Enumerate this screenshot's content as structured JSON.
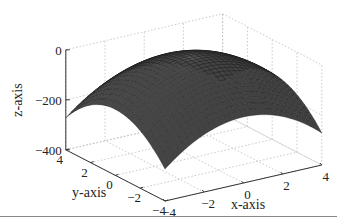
{
  "chart_data": {
    "type": "surface3d",
    "title": "",
    "function": "z = -8.5 * (x^2 + y^2)",
    "xlabel": "x-axis",
    "ylabel": "y-axis",
    "zlabel": "z-axis",
    "xlim": [
      -4,
      4
    ],
    "ylim": [
      -4,
      4
    ],
    "zlim": [
      -400,
      0
    ],
    "x_ticks": [
      -4,
      -2,
      0,
      2,
      4
    ],
    "y_ticks": [
      -4,
      -2,
      0,
      2,
      4
    ],
    "z_ticks": [
      -400,
      -200,
      0
    ],
    "x_tick_labels": [
      "−4",
      "−2",
      "0",
      "2",
      "4"
    ],
    "y_tick_labels": [
      "−4",
      "−2",
      "0",
      "2",
      "4"
    ],
    "z_tick_labels": [
      "−400",
      "−200",
      "0"
    ],
    "grid": true,
    "grid_n": 30,
    "corner_z": -272,
    "peak_z": 0,
    "colors": {
      "face_dark": "#2a2a2a",
      "face_light": "#8a8a8a",
      "edge": "#1a1a1a",
      "grid": "#bbbbbb",
      "axis": "#333333"
    }
  }
}
